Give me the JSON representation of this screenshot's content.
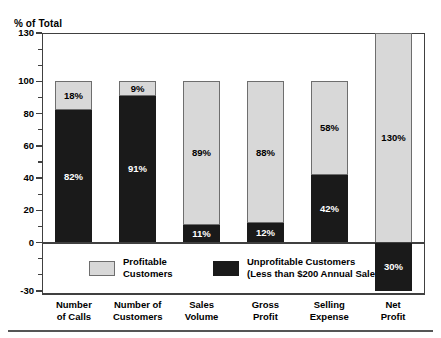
{
  "chart_data": {
    "type": "bar",
    "subtype": "stacked-bar",
    "title": "",
    "ylabel": "% of Total",
    "xlabel": "",
    "ylim": [
      -30,
      130
    ],
    "yticks": [
      130,
      100,
      80,
      60,
      40,
      20,
      0,
      -30
    ],
    "ytick_labels": [
      "130",
      "100",
      "80",
      "60",
      "40",
      "20",
      "0",
      "-30"
    ],
    "yminor_ticks": [
      120,
      110,
      90,
      70,
      50,
      30,
      10,
      -10,
      -20
    ],
    "grid": false,
    "legend_position": "inside-bottom",
    "categories": [
      "Number of Calls",
      "Number of Customers",
      "Sales Volume",
      "Gross Profit",
      "Selling Expense",
      "Net Profit"
    ],
    "category_lines": [
      [
        "Number",
        "of Calls"
      ],
      [
        "Number of",
        "Customers"
      ],
      [
        "Sales",
        "Volume"
      ],
      [
        "Gross",
        "Profit"
      ],
      [
        "Selling",
        "Expense"
      ],
      [
        "Net",
        "Profit"
      ]
    ],
    "series": [
      {
        "name": "Profitable Customers",
        "color": "#d8d8d8",
        "values": [
          18,
          9,
          89,
          88,
          58,
          130
        ],
        "labels": [
          "18%",
          "9%",
          "89%",
          "88%",
          "58%",
          "130%"
        ]
      },
      {
        "name": "Unprofitable Customers (Less than $200 Annual Sales)",
        "color": "#1a1a1a",
        "values": [
          82,
          91,
          11,
          12,
          42,
          -30
        ],
        "labels": [
          "82%",
          "91%",
          "11%",
          "12%",
          "42%",
          "30%"
        ]
      }
    ],
    "bars": [
      {
        "category": "Number of Calls",
        "segments": [
          {
            "series": "Profitable Customers",
            "value": 18,
            "label": "18%",
            "from": 82,
            "to": 100,
            "fill": "light"
          },
          {
            "series": "Unprofitable Customers",
            "value": 82,
            "label": "82%",
            "from": 0,
            "to": 82,
            "fill": "dark"
          }
        ]
      },
      {
        "category": "Number of Customers",
        "segments": [
          {
            "series": "Profitable Customers",
            "value": 9,
            "label": "9%",
            "from": 91,
            "to": 100,
            "fill": "light"
          },
          {
            "series": "Unprofitable Customers",
            "value": 91,
            "label": "91%",
            "from": 0,
            "to": 91,
            "fill": "dark"
          }
        ]
      },
      {
        "category": "Sales Volume",
        "segments": [
          {
            "series": "Profitable Customers",
            "value": 89,
            "label": "89%",
            "from": 11,
            "to": 100,
            "fill": "light"
          },
          {
            "series": "Unprofitable Customers",
            "value": 11,
            "label": "11%",
            "from": 0,
            "to": 11,
            "fill": "dark"
          }
        ]
      },
      {
        "category": "Gross Profit",
        "segments": [
          {
            "series": "Profitable Customers",
            "value": 88,
            "label": "88%",
            "from": 12,
            "to": 100,
            "fill": "light"
          },
          {
            "series": "Unprofitable Customers",
            "value": 12,
            "label": "12%",
            "from": 0,
            "to": 12,
            "fill": "dark"
          }
        ]
      },
      {
        "category": "Selling Expense",
        "segments": [
          {
            "series": "Profitable Customers",
            "value": 58,
            "label": "58%",
            "from": 42,
            "to": 100,
            "fill": "light"
          },
          {
            "series": "Unprofitable Customers",
            "value": 42,
            "label": "42%",
            "from": 0,
            "to": 42,
            "fill": "dark"
          }
        ]
      },
      {
        "category": "Net Profit",
        "segments": [
          {
            "series": "Profitable Customers",
            "value": 130,
            "label": "130%",
            "from": 0,
            "to": 130,
            "fill": "light"
          },
          {
            "series": "Unprofitable Customers",
            "value": -30,
            "label": "30%",
            "from": -30,
            "to": 0,
            "fill": "dark"
          }
        ]
      }
    ]
  },
  "legend": {
    "entries": [
      {
        "swatch": "light",
        "line1": "Profitable",
        "line2": "Customers"
      },
      {
        "swatch": "dark",
        "line1": "Unprofitable Customers",
        "line2": "(Less than $200 Annual Sales)"
      }
    ]
  },
  "colors": {
    "profitable": "#d8d8d8",
    "unprofitable": "#1a1a1a",
    "frame": "#404040",
    "background": "#ffffff"
  }
}
